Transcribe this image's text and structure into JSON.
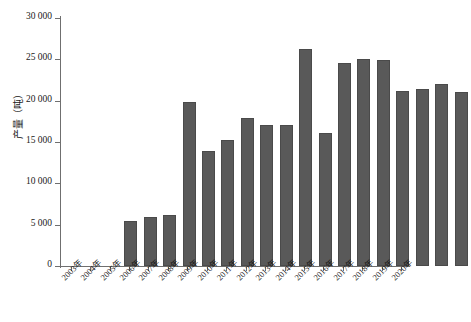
{
  "chart_data": {
    "type": "bar",
    "title": "",
    "xlabel": "",
    "ylabel": "产量（吨）",
    "ylim": [
      0,
      30000
    ],
    "grid": false,
    "legend": null,
    "ytick_labels": [
      "0",
      "5 000",
      "10 000",
      "15 000",
      "20 000",
      "25 000",
      "30 000"
    ],
    "ytick_values": [
      0,
      5000,
      10000,
      15000,
      20000,
      25000,
      30000
    ],
    "categories": [
      "2003年",
      "2004年",
      "2005年",
      "2006年",
      "2007年",
      "2008年",
      "2009年",
      "2010年",
      "2011年",
      "2012年",
      "2013年",
      "2014年",
      "2015年",
      "2016年",
      "2017年",
      "2018年",
      "2019年",
      "2020年"
    ],
    "values": [
      5400,
      5900,
      6200,
      19900,
      13900,
      15300,
      17900,
      17100,
      17000,
      26200,
      16100,
      24500,
      25000,
      24900,
      21200,
      21400,
      22000,
      21000
    ],
    "bar_color": "#595959",
    "axis_color": "#6f6f6f",
    "background": "#ffffff"
  }
}
